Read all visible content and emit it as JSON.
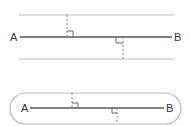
{
  "diagram": {
    "colors": {
      "main_line": "#555555",
      "boundary": "#bbbbbb",
      "perpendicular": "#888888",
      "label": "#333333"
    },
    "top_panel": {
      "description": "Parallel-line boundaries at equal distance from segment AB",
      "point_a_label": "A",
      "point_b_label": "B",
      "boundary_shape": "two parallel lines"
    },
    "bottom_panel": {
      "description": "Rounded (stadium) boundary at equal distance around segment AB",
      "point_a_label": "A",
      "point_b_label": "B",
      "boundary_shape": "stadium"
    }
  }
}
